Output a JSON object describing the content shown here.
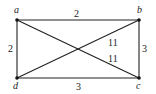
{
  "diagram": {
    "type": "weighted-graph",
    "vertices": [
      {
        "id": "a",
        "label": "a",
        "x": 17,
        "y": 20,
        "lx": 14,
        "ly": 13
      },
      {
        "id": "b",
        "label": "b",
        "x": 139,
        "y": 20,
        "lx": 137,
        "ly": 13
      },
      {
        "id": "c",
        "label": "c",
        "x": 139,
        "y": 78,
        "lx": 136,
        "ly": 89
      },
      {
        "id": "d",
        "label": "d",
        "x": 17,
        "y": 78,
        "lx": 13,
        "ly": 89
      }
    ],
    "edges": [
      {
        "from": "a",
        "to": "b",
        "weight": "2",
        "lx": 74,
        "ly": 17
      },
      {
        "from": "a",
        "to": "d",
        "weight": "2",
        "lx": 8,
        "ly": 52
      },
      {
        "from": "b",
        "to": "c",
        "weight": "3",
        "lx": 142,
        "ly": 52
      },
      {
        "from": "d",
        "to": "c",
        "weight": "3",
        "lx": 76,
        "ly": 90
      },
      {
        "from": "d",
        "to": "b",
        "weight": "11",
        "lx": 108,
        "ly": 46
      },
      {
        "from": "a",
        "to": "c",
        "weight": "11",
        "lx": 108,
        "ly": 62
      }
    ]
  }
}
